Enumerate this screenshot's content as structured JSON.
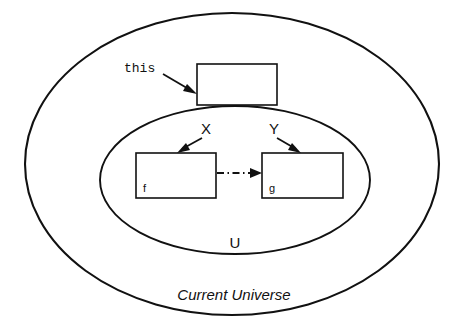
{
  "diagram": {
    "title_label": "Current Universe",
    "inner_region_label": "U",
    "pointer_label": "this",
    "arrow_label_left": "X",
    "arrow_label_right": "Y",
    "box_left_label": "f",
    "box_right_label": "g",
    "stroke_color": "#111111",
    "background_color": "#ffffff",
    "outer_region": {
      "name": "Current Universe",
      "shape": "ellipse",
      "cx": 232,
      "cy": 164,
      "rx": 207,
      "ry": 151
    },
    "inner_region": {
      "name": "U",
      "shape": "ellipse",
      "cx": 235,
      "cy": 180,
      "rx": 135,
      "ry": 74
    },
    "boxes": [
      {
        "name": "this-box",
        "label": "",
        "x": 197,
        "y": 64,
        "w": 80,
        "h": 41
      },
      {
        "name": "f-box",
        "label": "f",
        "x": 136,
        "y": 153,
        "w": 80,
        "h": 45
      },
      {
        "name": "g-box",
        "label": "g",
        "x": 262,
        "y": 153,
        "w": 81,
        "h": 45
      }
    ],
    "connectors": [
      {
        "name": "this-pointer",
        "style": "solid",
        "from_label": "this",
        "to": "this-box"
      },
      {
        "name": "x-pointer",
        "style": "solid",
        "from_label": "X",
        "to": "f-box"
      },
      {
        "name": "y-pointer",
        "style": "solid",
        "from_label": "Y",
        "to": "g-box"
      },
      {
        "name": "f-to-g",
        "style": "dash-dot",
        "from": "f-box",
        "to": "g-box"
      }
    ]
  }
}
